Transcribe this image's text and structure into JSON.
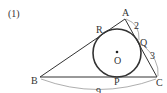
{
  "problem_number": "(1)",
  "points": {
    "A": "A",
    "B": "B",
    "C": "C",
    "P": "P",
    "Q": "Q",
    "R": "R",
    "O": "O"
  },
  "lengths": {
    "AQ": "2",
    "QC": "3",
    "BC": "9"
  },
  "colors": {
    "stroke": "#333333",
    "arc": "#555555"
  }
}
